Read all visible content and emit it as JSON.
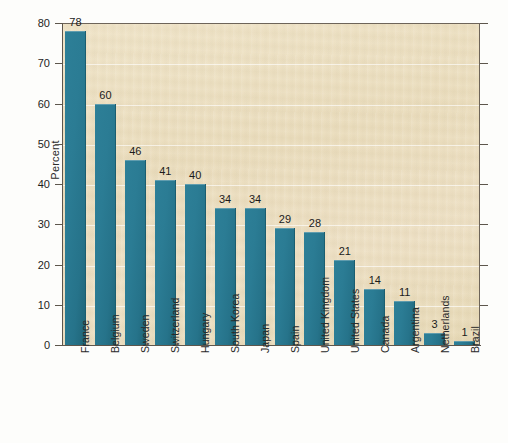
{
  "chart_data": {
    "type": "bar",
    "title": "",
    "xlabel": "",
    "ylabel": "Percent",
    "ylim": [
      0,
      80
    ],
    "ytick_step": 10,
    "yticks": [
      0,
      10,
      20,
      30,
      40,
      50,
      60,
      70,
      80
    ],
    "ytick_labels": [
      "0",
      "10",
      "20",
      "30",
      "40",
      "50",
      "60",
      "70",
      "80"
    ],
    "grid": true,
    "legend": "none",
    "bar_color": "#2b7c94",
    "plot_background": "#ebdcbd",
    "categories": [
      "France",
      "Belgium",
      "Sweden",
      "Switzerland",
      "Hungary",
      "South Korea",
      "Japan",
      "Spain",
      "United Kingdom",
      "United States",
      "Canada",
      "Argentina",
      "Netherlands",
      "Brazil"
    ],
    "values": [
      78,
      60,
      46,
      41,
      40,
      34,
      34,
      29,
      28,
      21,
      14,
      11,
      3,
      1
    ],
    "value_labels": [
      "78",
      "60",
      "46",
      "41",
      "40",
      "34",
      "34",
      "29",
      "28",
      "21",
      "14",
      "11",
      "3",
      "1"
    ]
  }
}
